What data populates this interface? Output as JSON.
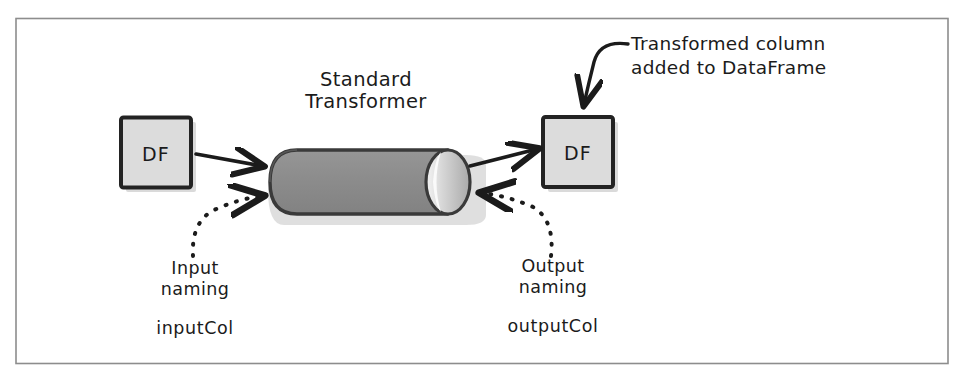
{
  "figure": {
    "frame": {
      "border_color": "#8a8a8a",
      "background": "#ffffff"
    },
    "input_box_label": "DF",
    "output_box_label": "DF",
    "annotation_line_1": "Transformed column",
    "annotation_line_2": "added to DataFrame",
    "input_naming_line_1": "Input",
    "input_naming_line_2": "naming",
    "input_param": "inputCol",
    "output_naming_line_1": "Output",
    "output_naming_line_2": "naming",
    "output_param": "outputCol",
    "colors": {
      "ink": "#1b1b1b",
      "box_fill": "#dcdcdc",
      "box_stroke": "#262626",
      "cylinder_body": "#8c8c8c",
      "cylinder_stroke": "#3a3a3a",
      "cylinder_cap": "#b5b5b5",
      "cylinder_highlight": "#f2f2f2",
      "shadow": "#bdbdbd"
    }
  }
}
